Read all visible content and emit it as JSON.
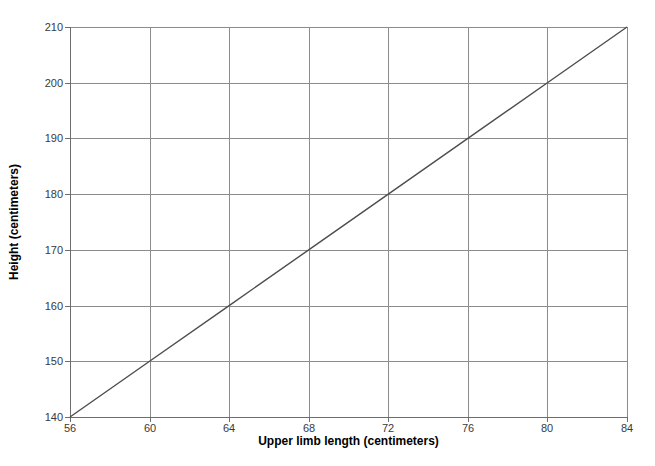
{
  "chart_data": {
    "type": "line",
    "title": "",
    "xlabel": "Upper limb length (centimeters)",
    "ylabel": "Height (centimeters)",
    "xlim": [
      56,
      84
    ],
    "ylim": [
      140,
      210
    ],
    "xticks": [
      56,
      60,
      64,
      68,
      72,
      76,
      80,
      84
    ],
    "xtick_labels": [
      "56",
      "60",
      "64",
      "68",
      "72",
      "76",
      "80",
      "84"
    ],
    "yticks": [
      140,
      150,
      160,
      170,
      180,
      190,
      200,
      210
    ],
    "ytick_labels": [
      "140",
      "150",
      "160",
      "170",
      "180",
      "190",
      "200",
      "210"
    ],
    "grid": true,
    "legend": null,
    "series": [
      {
        "name": "height vs upper limb length",
        "x": [
          56,
          60,
          64,
          68,
          72,
          76,
          80,
          84
        ],
        "values": [
          140,
          150,
          160,
          170,
          180,
          190,
          200,
          210
        ],
        "color": "#4d4d4d",
        "line_width": 1.4,
        "markers": false
      }
    ],
    "colors": {
      "background": "#ffffff",
      "grid": "#8c8c8c",
      "axis": "#6d6d6d",
      "tick_text": "#3a3a3a",
      "axis_title": "#000000",
      "line": "#4d4d4d"
    }
  }
}
